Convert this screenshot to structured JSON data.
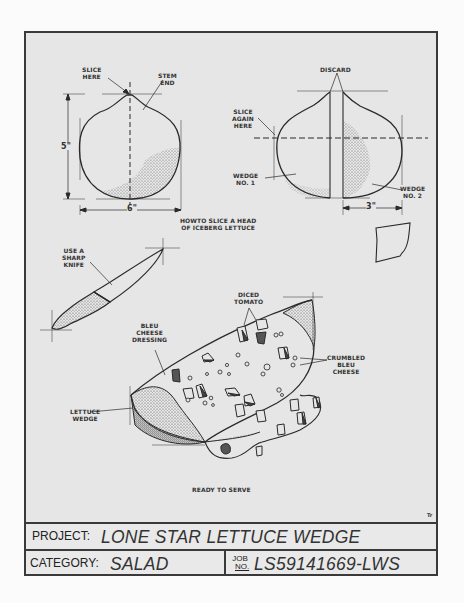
{
  "diagram": {
    "caption": "HOW TO SLICE A HEAD OF ICEBERG LETTUCE",
    "caption_line1": "HOWTO SLICE A HEAD",
    "caption_line2": "OF ICEBERG LETTUCE",
    "figure1": {
      "labels": {
        "slice_here_1": "SLICE",
        "slice_here_2": "HERE",
        "stem_end_1": "STEM",
        "stem_end_2": "END",
        "height_dim": "5\"",
        "width_dim": "6\""
      }
    },
    "figure2": {
      "labels": {
        "discard": "DISCARD",
        "slice_again_1": "SLICE",
        "slice_again_2": "AGAIN",
        "slice_again_3": "HERE",
        "wedge1_1": "WEDGE",
        "wedge1_2": "NO. 1",
        "wedge2_1": "WEDGE",
        "wedge2_2": "NO. 2",
        "width_dim": "3\""
      }
    },
    "knife": {
      "label_1": "USE A",
      "label_2": "SHARP",
      "label_3": "KNIFE"
    },
    "salad": {
      "diced_tomato_1": "DICED",
      "diced_tomato_2": "TOMATO",
      "bleu_dressing_1": "BLEU",
      "bleu_dressing_2": "CHEESE",
      "bleu_dressing_3": "DRESSING",
      "crumbled_1": "CRUMBLED",
      "crumbled_2": "BLEU",
      "crumbled_3": "CHEESE",
      "lettuce_1": "LETTUCE",
      "lettuce_2": "WEDGE",
      "ready": "READY TO SERVE"
    },
    "artist_mark": "Tr"
  },
  "title_block": {
    "project_label": "PROJECT:",
    "project_value": "LONE STAR LETTUCE WEDGE SALAD",
    "category_label": "CATEGORY:",
    "category_value": "SALAD",
    "job_label_1": "JOB",
    "job_label_2": "NO.",
    "job_value": "LS59141669-LWS"
  },
  "colors": {
    "paper": "#e6e6e6",
    "ink": "#333333",
    "border": "#3a3a3a"
  }
}
